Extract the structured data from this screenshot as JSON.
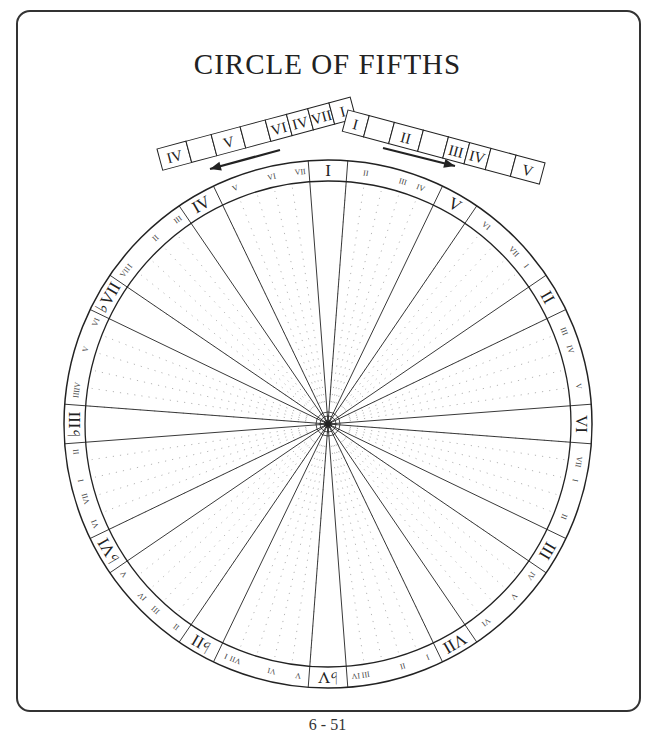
{
  "title": "CIRCLE OF FIFTHS",
  "page_number": "6 - 51",
  "left_scale": {
    "direction": "counter-clockwise",
    "cells": [
      "IV",
      "",
      "V",
      "",
      "VI",
      "IV",
      "VII",
      "I"
    ]
  },
  "right_scale": {
    "direction": "clockwise",
    "cells": [
      "I",
      "",
      "II",
      "",
      "III",
      "IV",
      "",
      "V"
    ]
  },
  "wheel": {
    "major_positions": [
      {
        "label": "I",
        "semitone": 0
      },
      {
        "label": "V",
        "semitone": 7
      },
      {
        "label": "II",
        "semitone": 2
      },
      {
        "label": "VI",
        "semitone": 9
      },
      {
        "label": "III",
        "semitone": 4
      },
      {
        "label": "VII",
        "semitone": 11
      },
      {
        "label": "♭V",
        "semitone": 6
      },
      {
        "label": "♭II",
        "semitone": 1
      },
      {
        "label": "♭VI",
        "semitone": 8
      },
      {
        "label": "♭III",
        "semitone": 3
      },
      {
        "label": "♭VII",
        "semitone": 10
      },
      {
        "label": "IV",
        "semitone": 5
      }
    ],
    "between_labels": [
      [
        "II",
        "III",
        "IV"
      ],
      [
        "VI",
        "VII",
        "I"
      ],
      [
        "III",
        "IV",
        "V"
      ],
      [
        "VII",
        "I",
        "II"
      ],
      [
        "IV",
        "V",
        "VI"
      ],
      [
        "I",
        "II",
        "III",
        "IV"
      ],
      [
        "V",
        "VI",
        "VII",
        "I"
      ],
      [
        "II",
        "III",
        "IV",
        "V"
      ],
      [
        "VI",
        "VII",
        "I",
        "II"
      ],
      [
        "III",
        "IV",
        "V",
        "VI"
      ],
      [
        "VII",
        "I",
        "II",
        "III"
      ],
      [
        "V",
        "VI",
        "VII"
      ]
    ]
  },
  "colors": {
    "ink": "#222222",
    "dots": "#b5b5b5"
  }
}
